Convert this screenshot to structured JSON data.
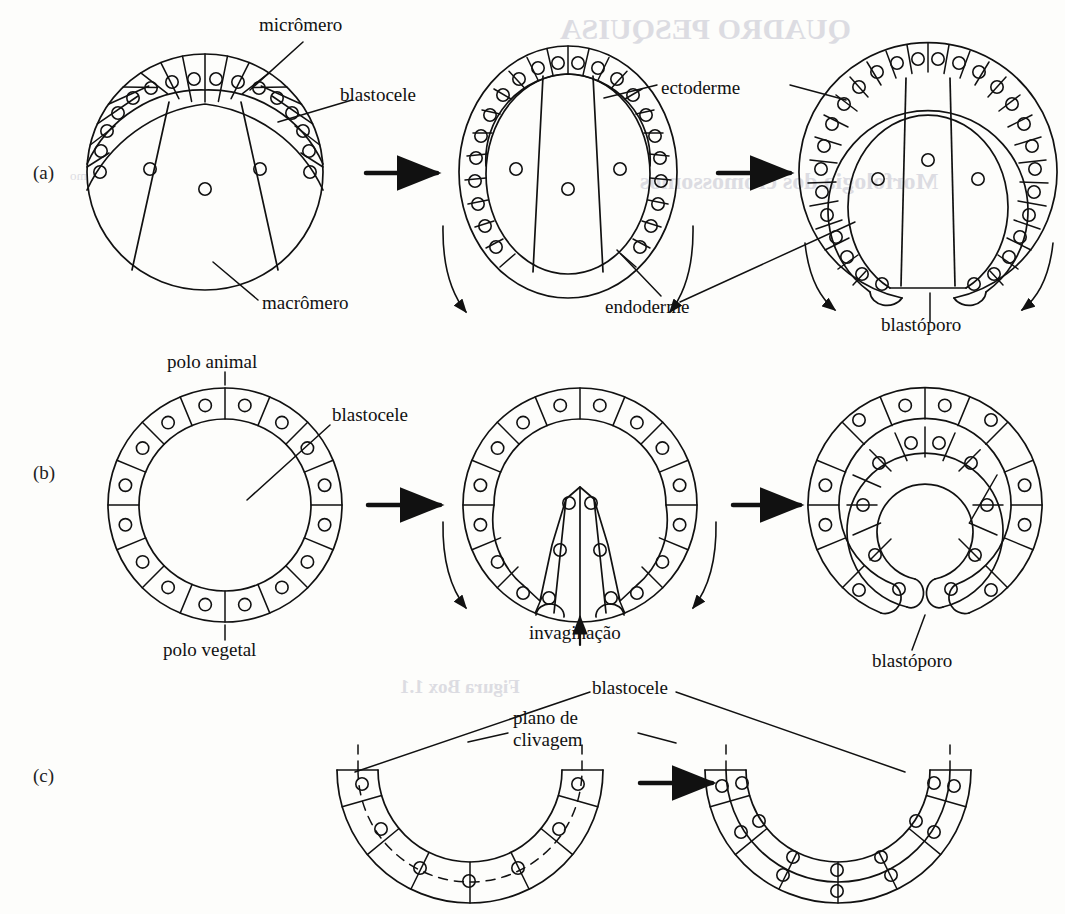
{
  "figure": {
    "background_color": "#fdfdfb",
    "ink_color": "#111111",
    "rows": [
      {
        "id": "a",
        "letter": "(a)"
      },
      {
        "id": "b",
        "letter": "(b)"
      },
      {
        "id": "c",
        "letter": "(c)"
      }
    ]
  },
  "labels": {
    "micromero": "micrômero",
    "blastocele_a": "blastocele",
    "macromero": "macrômero",
    "ectoderme": "ectoderme",
    "endoderme": "endoderme",
    "blastoporo_a": "blastóporo",
    "polo_animal": "polo animal",
    "blastocele_b": "blastocele",
    "polo_vegetal": "polo vegetal",
    "invaginacao": "invaginação",
    "blastoporo_b": "blastóporo",
    "blastocele_c": "blastocele",
    "plano_de_clivagem_line1": "plano de",
    "plano_de_clivagem_line2": "clivagem"
  },
  "chart_data": {
    "type": "diagram",
    "rows": [
      {
        "id": "a",
        "letter": "(a)",
        "description": "Blástula com micrômeros e macrômeros evoluindo para gástrula com blastóporo",
        "stages": [
          {
            "index": 1,
            "name": "blástula",
            "annotations": [
              "micrômero",
              "blastocele",
              "macrômero"
            ],
            "micromere_count": 16,
            "macromere_count": 3
          },
          {
            "index": 2,
            "name": "gástrula inicial",
            "annotations": [
              "ectoderme",
              "endoderme"
            ],
            "ectoderm_cells": 26,
            "endoderm_cells": 3
          },
          {
            "index": 3,
            "name": "gástrula com blastóporo",
            "annotations": [
              "ectoderme",
              "blastóporo"
            ],
            "ectoderm_cells": 28,
            "endoderm_cells": 3
          }
        ],
        "arrows": 2,
        "curved_flow_arrows": 4
      },
      {
        "id": "b",
        "letter": "(b)",
        "description": "Blástula oca com blastocele central, invaginação e formação do blastóporo",
        "stages": [
          {
            "index": 1,
            "name": "blástula",
            "annotations": [
              "polo animal",
              "blastocele",
              "polo vegetal"
            ],
            "cell_count": 16
          },
          {
            "index": 2,
            "name": "invaginação",
            "annotations": [
              "invaginação"
            ],
            "cell_count": 16
          },
          {
            "index": 3,
            "name": "gástrula",
            "annotations": [
              "blastóporo"
            ],
            "outer_cells": 12,
            "inner_cells": 10
          }
        ],
        "arrows": 2,
        "curved_flow_arrows": 2
      },
      {
        "id": "c",
        "letter": "(c)",
        "description": "Arco de células em U com planos de clivagem tangenciais gerando duas camadas",
        "stages": [
          {
            "index": 1,
            "name": "camada única com planos de clivagem",
            "annotations": [
              "blastocele",
              "plano de clivagem"
            ],
            "cell_count": 7,
            "layers": 1
          },
          {
            "index": 2,
            "name": "duas camadas após clivagem",
            "annotations": [
              "blastocele",
              "plano de clivagem"
            ],
            "cell_count": 14,
            "layers": 2
          }
        ],
        "arrows": 1
      }
    ],
    "legend": [],
    "xlabel": "",
    "ylabel": ""
  },
  "bleedthrough": [
    {
      "text": "QUADRO PESQUISA",
      "x": 560,
      "y": 12,
      "size": 30,
      "weight": "bold"
    },
    {
      "text": "Morfologia dos cromossomos",
      "x": 640,
      "y": 168,
      "size": 24,
      "weight": "bold"
    },
    {
      "text": "mo",
      "x": 70,
      "y": 168,
      "size": 13,
      "weight": "normal"
    },
    {
      "text": "Figura Box 1.1",
      "x": 400,
      "y": 676,
      "size": 19,
      "weight": "bold"
    }
  ]
}
